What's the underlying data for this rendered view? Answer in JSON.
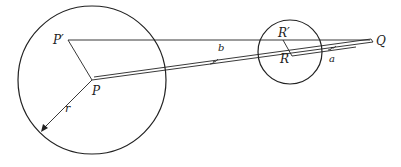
{
  "diagram": {
    "labels": {
      "P_prime": "P′",
      "P": "P",
      "r": "r",
      "b": "b",
      "R_prime": "R′",
      "R": "R",
      "a": "a",
      "Q": "Q"
    },
    "colors": {
      "stroke": "#222222",
      "background": "#ffffff"
    }
  }
}
